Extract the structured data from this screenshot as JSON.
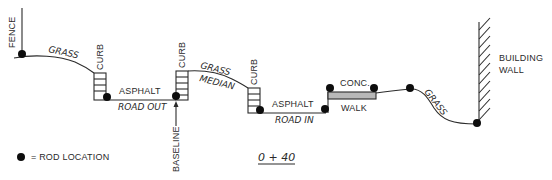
{
  "diagram": {
    "type": "cross-section profile",
    "station_label": "0 + 40",
    "legend": {
      "symbol": "rod-dot",
      "text": "= ROD LOCATION"
    },
    "labels": {
      "fence": "FENCE",
      "grass_left": "GRASS",
      "curb_1": "CURB",
      "asphalt_out": "ASPHALT",
      "road_out": "ROAD OUT",
      "curb_2": "CURB",
      "baseline": "BASELINE",
      "grass_median_1": "GRASS",
      "grass_median_2": "MEDIAN",
      "curb_3": "CURB",
      "asphalt_in": "ASPHALT",
      "road_in": "ROAD IN",
      "conc": "CONC.",
      "walk": "WALK",
      "grass_right": "GRASS",
      "building_1": "BUILDING",
      "building_2": "WALL"
    },
    "rod_locations": [
      {
        "name": "fence",
        "x": 22,
        "y": 54
      },
      {
        "name": "curb-1-toe",
        "x": 107,
        "y": 97
      },
      {
        "name": "curb-2-toe",
        "x": 176,
        "y": 96
      },
      {
        "name": "curb-3-toe",
        "x": 260,
        "y": 110
      },
      {
        "name": "road-in-edge",
        "x": 326,
        "y": 110
      },
      {
        "name": "walk-left",
        "x": 330,
        "y": 88
      },
      {
        "name": "walk-right",
        "x": 374,
        "y": 88
      },
      {
        "name": "grass-top",
        "x": 410,
        "y": 88
      },
      {
        "name": "wall-base",
        "x": 477,
        "y": 123
      }
    ],
    "colors": {
      "line": "#2b2b2b",
      "rod": "#0d0d0d",
      "walk_fill": "#b8b8b8",
      "text": "#2a2a2a"
    }
  }
}
